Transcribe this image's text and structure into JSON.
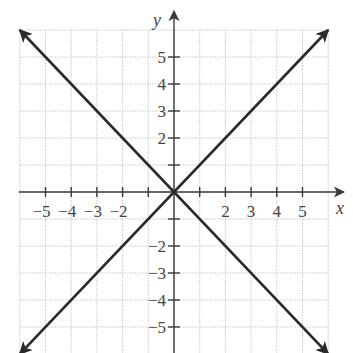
{
  "chart_data": {
    "type": "line",
    "title": "",
    "xlabel": "x",
    "ylabel": "y",
    "xlim": [
      -6,
      6
    ],
    "ylim": [
      -6,
      6
    ],
    "grid": true,
    "x_tick_labels": [
      "−5",
      "−4",
      "−3",
      "−2",
      "2",
      "3",
      "4",
      "5"
    ],
    "x_tick_values": [
      -5,
      -4,
      -3,
      -2,
      2,
      3,
      4,
      5
    ],
    "y_tick_labels": [
      "5",
      "4",
      "3",
      "2",
      "−2",
      "−3",
      "−4",
      "−5"
    ],
    "y_tick_values": [
      5,
      4,
      3,
      2,
      -2,
      -3,
      -4,
      -5
    ],
    "series": [
      {
        "name": "y = x",
        "points": [
          [
            -6,
            -6
          ],
          [
            6,
            6
          ]
        ],
        "arrows": "both"
      },
      {
        "name": "y = -x",
        "points": [
          [
            -6,
            6
          ],
          [
            6,
            -6
          ]
        ],
        "arrows": "both"
      }
    ]
  },
  "colors": {
    "line": "#2a2a2a",
    "axis": "#3a3a3a",
    "grid": "#b8b8b8",
    "label": "#444444"
  }
}
